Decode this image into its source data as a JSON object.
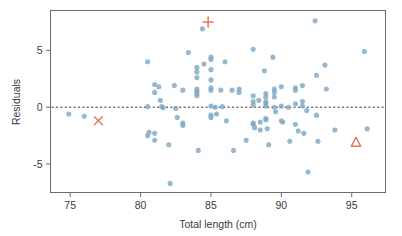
{
  "chart_data": {
    "type": "scatter",
    "title": "",
    "xlabel": "Total length (cm)",
    "ylabel": "Residuals",
    "xlim": [
      73.6,
      97.4
    ],
    "ylim": [
      -7.5,
      8.5
    ],
    "xticks": [
      75,
      80,
      85,
      90,
      95
    ],
    "xtick_labels": [
      "75",
      "80",
      "85",
      "90",
      "95"
    ],
    "yticks": [
      5,
      0,
      -5
    ],
    "ytick_labels": [
      "5",
      "0",
      "-5"
    ],
    "grid": false,
    "legend": null,
    "reference_line": {
      "name": "zero-residual-line",
      "orientation": "horizontal",
      "y": 0,
      "style": "dashed",
      "color": "#333333"
    },
    "series": [
      {
        "name": "residuals",
        "marker": "circle",
        "color": "#7fa8c4",
        "points": [
          [
            74.9,
            -0.6
          ],
          [
            76.0,
            -0.8
          ],
          [
            80.5,
            4.0
          ],
          [
            80.5,
            0.05
          ],
          [
            80.5,
            -2.5
          ],
          [
            80.6,
            -2.2
          ],
          [
            81.0,
            2.0
          ],
          [
            81.0,
            1.3
          ],
          [
            81.0,
            -2.3
          ],
          [
            81.0,
            -2.9
          ],
          [
            81.3,
            1.8
          ],
          [
            81.4,
            0.6
          ],
          [
            81.5,
            0.05
          ],
          [
            81.6,
            -0.05
          ],
          [
            82.0,
            -3.3
          ],
          [
            82.1,
            -6.7
          ],
          [
            82.4,
            1.9
          ],
          [
            82.5,
            -0.1
          ],
          [
            82.6,
            -0.9
          ],
          [
            83.0,
            1.5
          ],
          [
            83.0,
            -1.4
          ],
          [
            83.0,
            -1.6
          ],
          [
            83.4,
            4.8
          ],
          [
            84.0,
            3.5
          ],
          [
            84.0,
            3.1
          ],
          [
            84.0,
            2.6
          ],
          [
            84.0,
            1.6
          ],
          [
            84.0,
            1.4
          ],
          [
            84.0,
            1.2
          ],
          [
            84.0,
            1.0
          ],
          [
            84.1,
            -3.8
          ],
          [
            84.4,
            6.9
          ],
          [
            84.5,
            3.8
          ],
          [
            85.0,
            4.4
          ],
          [
            85.0,
            4.2
          ],
          [
            85.0,
            3.3
          ],
          [
            85.0,
            2.4
          ],
          [
            85.0,
            1.7
          ],
          [
            85.0,
            1.5
          ],
          [
            85.0,
            0.1
          ],
          [
            85.0,
            -0.7
          ],
          [
            85.0,
            -0.9
          ],
          [
            85.3,
            0.0
          ],
          [
            85.4,
            -0.6
          ],
          [
            85.7,
            1.5
          ],
          [
            85.8,
            0.05
          ],
          [
            86.0,
            4.0
          ],
          [
            86.1,
            -1.2
          ],
          [
            86.5,
            1.5
          ],
          [
            86.6,
            -3.8
          ],
          [
            87.0,
            1.3
          ],
          [
            87.0,
            1.6
          ],
          [
            87.5,
            -2.9
          ],
          [
            88.0,
            5.1
          ],
          [
            88.0,
            1.0
          ],
          [
            88.0,
            0.5
          ],
          [
            88.0,
            0.2
          ],
          [
            88.0,
            -1.4
          ],
          [
            88.0,
            -1.5
          ],
          [
            88.1,
            -1.8
          ],
          [
            88.4,
            0.6
          ],
          [
            88.5,
            -1.3
          ],
          [
            88.5,
            -2.0
          ],
          [
            88.8,
            3.2
          ],
          [
            88.9,
            1.2
          ],
          [
            88.9,
            0.9
          ],
          [
            88.9,
            0.5
          ],
          [
            88.9,
            0.3
          ],
          [
            88.9,
            0.1
          ],
          [
            88.9,
            -1.0
          ],
          [
            88.9,
            -1.1
          ],
          [
            89.0,
            -1.9
          ],
          [
            89.1,
            -3.3
          ],
          [
            89.4,
            4.4
          ],
          [
            89.5,
            1.6
          ],
          [
            89.5,
            1.3
          ],
          [
            89.5,
            0.9
          ],
          [
            89.5,
            0.0
          ],
          [
            89.6,
            -0.4
          ],
          [
            90.0,
            1.8
          ],
          [
            90.0,
            0.1
          ],
          [
            90.0,
            -1.2
          ],
          [
            90.1,
            -1.3
          ],
          [
            90.5,
            0.0
          ],
          [
            90.6,
            -3.0
          ],
          [
            91.0,
            1.7
          ],
          [
            91.0,
            1.5
          ],
          [
            91.0,
            0.3
          ],
          [
            91.0,
            -1.5
          ],
          [
            91.2,
            -2.1
          ],
          [
            91.5,
            1.9
          ],
          [
            91.5,
            0.5
          ],
          [
            91.5,
            0.1
          ],
          [
            91.6,
            -2.3
          ],
          [
            91.8,
            -0.3
          ],
          [
            91.9,
            -5.7
          ],
          [
            92.4,
            7.6
          ],
          [
            92.5,
            2.8
          ],
          [
            92.5,
            -0.7
          ],
          [
            92.6,
            -3.0
          ],
          [
            93.1,
            3.7
          ],
          [
            93.2,
            1.6
          ],
          [
            93.8,
            -2.0
          ],
          [
            95.9,
            4.9
          ],
          [
            96.1,
            -1.9
          ]
        ]
      },
      {
        "name": "highlighted-observations",
        "color": "#e8795a",
        "points": [
          {
            "marker": "x",
            "x": 77.0,
            "y": -1.2,
            "label": "x-marker"
          },
          {
            "marker": "plus",
            "x": 84.8,
            "y": 7.5,
            "label": "plus-marker"
          },
          {
            "marker": "triangle",
            "x": 95.3,
            "y": -3.1,
            "label": "triangle-marker"
          }
        ]
      }
    ]
  },
  "figure": {
    "frame_color": "#6b6b6b",
    "background": "#ffffff"
  }
}
